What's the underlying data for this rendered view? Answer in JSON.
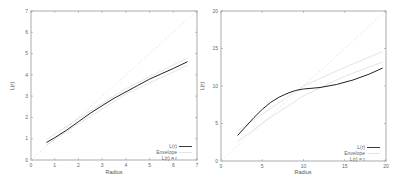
{
  "chart_data": [
    {
      "type": "line",
      "title": "",
      "xlabel": "Radius",
      "ylabel": "L(r)",
      "xlim": [
        0,
        7
      ],
      "ylim": [
        0,
        7
      ],
      "xticks": [
        "0",
        "1",
        "2",
        "3",
        "4",
        "5",
        "6",
        "7"
      ],
      "yticks": [
        "0",
        "1",
        "2",
        "3",
        "4",
        "5",
        "6",
        "7"
      ],
      "grid": false,
      "legend_position": "lower right",
      "legend": [
        "L(r)",
        "Envelope",
        "L(r) = r"
      ],
      "series": [
        {
          "name": "L(r)",
          "style": "solid-black",
          "x": [
            0.65,
            1.0,
            1.5,
            2.0,
            2.5,
            3.0,
            3.5,
            4.0,
            4.5,
            5.0,
            5.5,
            6.0,
            6.6
          ],
          "y": [
            0.82,
            1.05,
            1.4,
            1.8,
            2.2,
            2.55,
            2.9,
            3.2,
            3.5,
            3.8,
            4.05,
            4.3,
            4.62
          ]
        },
        {
          "name": "Envelope (upper)",
          "style": "solid-light",
          "x": [
            0.65,
            2.0,
            4.0,
            6.6
          ],
          "y": [
            0.95,
            1.95,
            3.35,
            4.8
          ]
        },
        {
          "name": "Envelope (lower)",
          "style": "solid-light",
          "x": [
            0.65,
            2.0,
            4.0,
            6.6
          ],
          "y": [
            0.7,
            1.7,
            3.1,
            4.45
          ]
        },
        {
          "name": "L(r) = r",
          "style": "dashed-light",
          "x": [
            0,
            7
          ],
          "y": [
            0,
            7
          ]
        }
      ]
    },
    {
      "type": "line",
      "title": "",
      "xlabel": "Radius",
      "ylabel": "L(r)",
      "xlim": [
        0,
        20
      ],
      "ylim": [
        0,
        20
      ],
      "xticks": [
        "0",
        "5",
        "10",
        "15",
        "20"
      ],
      "yticks": [
        "0",
        "5",
        "10",
        "15",
        "20"
      ],
      "grid": false,
      "legend_position": "lower right",
      "legend": [
        "L(r)",
        "Envelope",
        "L(r) = r"
      ],
      "series": [
        {
          "name": "L(r)",
          "style": "solid-black",
          "x": [
            2,
            3,
            4,
            5,
            6,
            7,
            8,
            9,
            10,
            12,
            14,
            16,
            18,
            19.6
          ],
          "y": [
            3.4,
            4.6,
            5.8,
            6.9,
            7.8,
            8.5,
            9.0,
            9.4,
            9.6,
            9.8,
            10.2,
            10.8,
            11.6,
            12.4
          ]
        },
        {
          "name": "Envelope (upper)",
          "style": "solid-light",
          "x": [
            2,
            6,
            10,
            15,
            19.6
          ],
          "y": [
            4.0,
            7.0,
            10.0,
            12.5,
            14.6
          ]
        },
        {
          "name": "Envelope (lower)",
          "style": "solid-light",
          "x": [
            2,
            6,
            10,
            15,
            19.6
          ],
          "y": [
            2.6,
            5.8,
            8.7,
            11.3,
            13.2
          ]
        },
        {
          "name": "L(r) = r",
          "style": "dashed-light",
          "x": [
            0,
            20
          ],
          "y": [
            0,
            20
          ]
        }
      ]
    }
  ],
  "left": {
    "xlabel": "Radius",
    "ylabel": "L(r)",
    "xticks": [
      "0",
      "1",
      "2",
      "3",
      "4",
      "5",
      "6",
      "7"
    ],
    "yticks": [
      "0",
      "1",
      "2",
      "3",
      "4",
      "5",
      "6",
      "7"
    ],
    "legend": [
      "L(r)",
      "Envelope",
      "L(r) = r"
    ]
  },
  "right": {
    "xlabel": "Radius",
    "ylabel": "L(r)",
    "xticks": [
      "0",
      "5",
      "10",
      "15",
      "20"
    ],
    "yticks": [
      "0",
      "5",
      "10",
      "15",
      "20"
    ],
    "legend": [
      "L(r)",
      "Envelope",
      "L(r) = r"
    ]
  },
  "colors": {
    "curve": "#222222",
    "envelope": "#d0d0d0",
    "diagonal": "#dddddd",
    "frame": "#888888"
  }
}
